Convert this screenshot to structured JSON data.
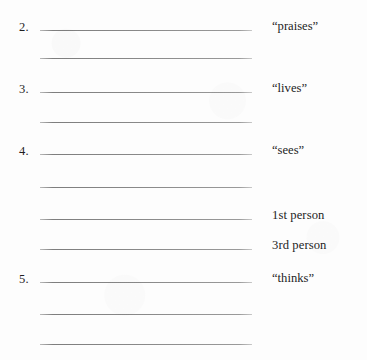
{
  "page": {
    "background_color": "#fdfdfd",
    "rule_color": "#8a8a8a",
    "text_color": "#1e1e1e"
  },
  "rows": [
    {
      "number": "2.",
      "label": "“praises”",
      "y": 31,
      "has_number": true,
      "has_rule": true,
      "has_label": true
    },
    {
      "number": "",
      "label": "",
      "y": 59,
      "has_number": false,
      "has_rule": true,
      "has_label": false
    },
    {
      "number": "3.",
      "label": "“lives”",
      "y": 93,
      "has_number": true,
      "has_rule": true,
      "has_label": true
    },
    {
      "number": "",
      "label": "",
      "y": 123,
      "has_number": false,
      "has_rule": true,
      "has_label": false
    },
    {
      "number": "4.",
      "label": "“sees”",
      "y": 155,
      "has_number": true,
      "has_rule": true,
      "has_label": true
    },
    {
      "number": "",
      "label": "",
      "y": 188,
      "has_number": false,
      "has_rule": true,
      "has_label": false
    },
    {
      "number": "",
      "label": "1st person",
      "y": 220,
      "has_number": false,
      "has_rule": true,
      "has_label": true
    },
    {
      "number": "",
      "label": "3rd person",
      "y": 250,
      "has_number": false,
      "has_rule": true,
      "has_label": true
    },
    {
      "number": "5.",
      "label": "“thinks”",
      "y": 283,
      "has_number": true,
      "has_rule": true,
      "has_label": true
    },
    {
      "number": "",
      "label": "",
      "y": 315,
      "has_number": false,
      "has_rule": true,
      "has_label": false
    },
    {
      "number": "",
      "label": "",
      "y": 345,
      "has_number": false,
      "has_rule": true,
      "has_label": false
    }
  ]
}
